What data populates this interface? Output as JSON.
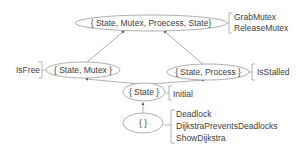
{
  "diagram": {
    "type": "lattice",
    "nodes": [
      {
        "id": "top",
        "label": "{ State, Mutex, Proecess, State}",
        "annotations": [
          "GrabMutex",
          "ReleaseMutex"
        ]
      },
      {
        "id": "state_mutex",
        "label": "{ State, Mutex }",
        "annotations": [
          "IsFree"
        ]
      },
      {
        "id": "state_process",
        "label": "{ State, Process }",
        "annotations": [
          "IsStalled"
        ]
      },
      {
        "id": "state",
        "label": "{ State }",
        "annotations": [
          "Initial"
        ]
      },
      {
        "id": "empty",
        "label": "{ }",
        "annotations": [
          "Deadlock",
          "DijkstraPreventsDeadlocks",
          "ShowDijkstra"
        ]
      }
    ],
    "edges": [
      {
        "from": "empty",
        "to": "state"
      },
      {
        "from": "state",
        "to": "state_mutex"
      },
      {
        "from": "state",
        "to": "state_process"
      },
      {
        "from": "state_mutex",
        "to": "top"
      },
      {
        "from": "state_process",
        "to": "top"
      }
    ]
  },
  "colors": {
    "stroke": "#9a9a9a",
    "text": "#404040",
    "background": "#ffffff"
  }
}
